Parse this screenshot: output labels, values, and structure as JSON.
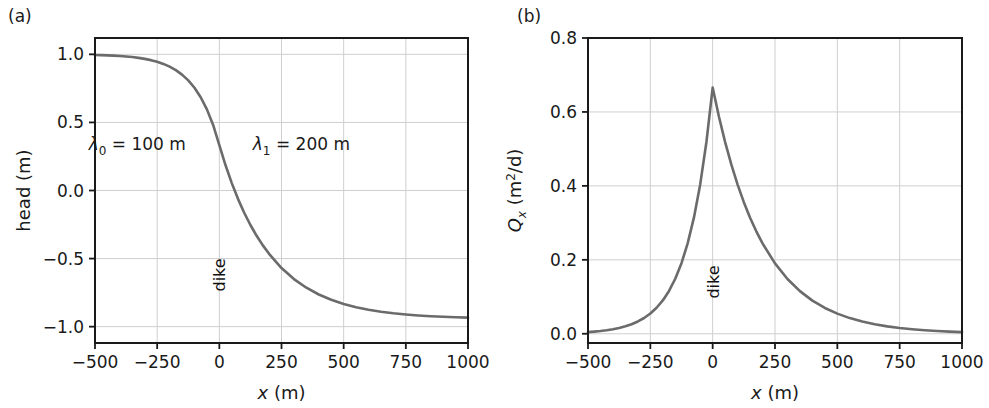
{
  "figure": {
    "panels": [
      {
        "tag": "(a)",
        "name": "head-panel",
        "xlabel_var": "x",
        "xlabel_unit": " (m)",
        "ylabel": "head (m)",
        "xticks": [
          "−500",
          "−250",
          "0",
          "250",
          "500",
          "750",
          "1000"
        ],
        "yticks": [
          "1.00",
          "0.50",
          "0.00",
          "−0.50",
          "−1.00"
        ],
        "ytick_display": [
          "1.0",
          "0.5",
          "0.0",
          "−0.5",
          "−1.0"
        ],
        "annotations": [
          {
            "name": "lambda0-annotation",
            "symbol": "λ",
            "sub": "0",
            "eq": " = ",
            "value": "100",
            "unit": " m"
          },
          {
            "name": "lambda1-annotation",
            "symbol": "λ",
            "sub": "1",
            "eq": " = ",
            "value": "200",
            "unit": " m"
          }
        ],
        "dike_label": "dike"
      },
      {
        "tag": "(b)",
        "name": "discharge-panel",
        "xlabel_var": "x",
        "xlabel_unit": " (m)",
        "ylabel_var": "Q",
        "ylabel_sub": "x",
        "ylabel_unit": " (m",
        "ylabel_exp": "2",
        "ylabel_unit2": "/d)",
        "xticks": [
          "−500",
          "−250",
          "0",
          "250",
          "500",
          "750",
          "1000"
        ],
        "yticks": [
          "0.8",
          "0.6",
          "0.4",
          "0.2",
          "0.0"
        ],
        "dike_label": "dike"
      }
    ],
    "colors": {
      "curve": "#6b6b6b",
      "axis": "#1a1a1a",
      "grid": "#cfcfcf",
      "background": "#ffffff",
      "text": "#1a1a1a"
    }
  },
  "chart_data": [
    {
      "type": "line",
      "panel": "(a)",
      "title": "",
      "xlabel": "x (m)",
      "ylabel": "head (m)",
      "xlim": [
        -500,
        1000
      ],
      "ylim": [
        -1.12,
        1.12
      ],
      "xticks": [
        -500,
        -250,
        0,
        250,
        500,
        750,
        1000
      ],
      "yticks": [
        -1.0,
        -0.5,
        0.0,
        0.5,
        1.0
      ],
      "grid": true,
      "legend": "none",
      "parameters": {
        "lambda_0": 100,
        "lambda_1": 200,
        "head_left_far": 1.0,
        "head_right_far": -1.0,
        "head_at_dike": 0.333
      },
      "annotations": [
        {
          "text": "λ0 = 100 m",
          "x": -330,
          "y": 0.3
        },
        {
          "text": "λ1 = 200 m",
          "x": 330,
          "y": 0.3
        },
        {
          "text": "dike",
          "x": 0,
          "y": -0.62,
          "rotation": 90
        }
      ],
      "series": [
        {
          "name": "head",
          "x": [
            -500,
            -475,
            -450,
            -425,
            -400,
            -375,
            -350,
            -325,
            -300,
            -275,
            -250,
            -225,
            -200,
            -175,
            -150,
            -125,
            -100,
            -75,
            -50,
            -25,
            0,
            25,
            50,
            75,
            100,
            125,
            150,
            175,
            200,
            250,
            300,
            350,
            400,
            450,
            500,
            550,
            600,
            650,
            700,
            750,
            800,
            850,
            900,
            950,
            1000
          ],
          "y": [
            0.9955,
            0.9942,
            0.9926,
            0.9905,
            0.9878,
            0.9844,
            0.9799,
            0.9742,
            0.9668,
            0.9574,
            0.9452,
            0.9297,
            0.9098,
            0.8843,
            0.8513,
            0.809,
            0.7547,
            0.6851,
            0.5958,
            0.4812,
            0.3333,
            0.1852,
            0.0543,
            -0.0613,
            -0.1632,
            -0.2533,
            -0.3328,
            -0.4031,
            -0.4652,
            -0.5693,
            -0.6505,
            -0.7141,
            -0.7638,
            -0.8027,
            -0.8331,
            -0.857,
            -0.8756,
            -0.8902,
            -0.9017,
            -0.9106,
            -0.9176,
            -0.9231,
            -0.9274,
            -0.9308,
            -0.9334
          ]
        }
      ]
    },
    {
      "type": "line",
      "panel": "(b)",
      "title": "",
      "xlabel": "x (m)",
      "ylabel": "Qx (m2/d)",
      "xlim": [
        -500,
        1000
      ],
      "ylim": [
        -0.025,
        0.8
      ],
      "xticks": [
        -500,
        -250,
        0,
        250,
        500,
        750,
        1000
      ],
      "yticks": [
        0.0,
        0.2,
        0.4,
        0.6,
        0.8
      ],
      "grid": true,
      "legend": "none",
      "parameters": {
        "lambda_0": 100,
        "lambda_1": 200,
        "peak_value": 0.666,
        "peak_x": 0
      },
      "annotations": [
        {
          "text": "dike",
          "x": 0,
          "y": 0.14,
          "rotation": 90
        }
      ],
      "series": [
        {
          "name": "Qx",
          "x": [
            -500,
            -475,
            -450,
            -425,
            -400,
            -375,
            -350,
            -325,
            -300,
            -275,
            -250,
            -225,
            -200,
            -175,
            -150,
            -125,
            -100,
            -75,
            -50,
            -25,
            0,
            25,
            50,
            75,
            100,
            125,
            150,
            175,
            200,
            250,
            300,
            350,
            400,
            450,
            500,
            550,
            600,
            650,
            700,
            750,
            800,
            850,
            900,
            950,
            1000
          ],
          "y": [
            0.0045,
            0.0058,
            0.0074,
            0.0095,
            0.0122,
            0.0157,
            0.0201,
            0.0258,
            0.0332,
            0.0426,
            0.0547,
            0.0703,
            0.0902,
            0.1158,
            0.1487,
            0.1909,
            0.2451,
            0.3147,
            0.404,
            0.5187,
            0.666,
            0.5876,
            0.5184,
            0.4574,
            0.4035,
            0.356,
            0.314,
            0.2771,
            0.2444,
            0.1903,
            0.1481,
            0.1153,
            0.0897,
            0.0698,
            0.0544,
            0.0423,
            0.0329,
            0.0256,
            0.0199,
            0.0155,
            0.0121,
            0.0094,
            0.0073,
            0.0057,
            0.0044
          ]
        }
      ]
    }
  ]
}
